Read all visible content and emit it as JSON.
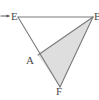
{
  "figure": {
    "kind": "geometry-diagram",
    "canvas": {
      "width": 99,
      "height": 100,
      "background": "#ffffff"
    },
    "style": {
      "stroke_color": "#7a7a7a",
      "stroke_width": 1,
      "shaded_fill": "#dedede",
      "label_color": "#4a4a4a",
      "pointer_color": "#5a5a5a"
    },
    "points": [
      {
        "id": "E",
        "label": "E",
        "x": 18,
        "y": 17
      },
      {
        "id": "B",
        "label": "B",
        "x": 93,
        "y": 17
      },
      {
        "id": "A",
        "label": "A",
        "x": 38,
        "y": 55
      },
      {
        "id": "F",
        "label": "F",
        "x": 60,
        "y": 87
      }
    ],
    "segments": [
      {
        "id": "EB",
        "from": "E",
        "to": "B"
      },
      {
        "id": "EF",
        "from": "E",
        "to": "F"
      },
      {
        "id": "BF",
        "from": "B",
        "to": "F"
      },
      {
        "id": "AB",
        "from": "A",
        "to": "B"
      }
    ],
    "shaded_region": {
      "id": "triangle-ABF",
      "vertices": [
        "A",
        "B",
        "F"
      ],
      "fill": "#dedede"
    },
    "pointer": {
      "id": "arrow-to-E",
      "label": "",
      "target": "E",
      "direction": "right",
      "x_start": 1,
      "x_end": 10,
      "y": 16
    },
    "labels": {
      "E": "E",
      "A": "A",
      "F": "F",
      "B": "B"
    }
  }
}
